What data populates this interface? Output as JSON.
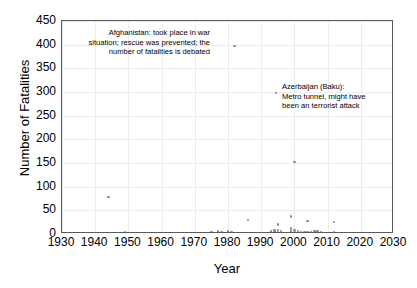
{
  "chart_data": {
    "type": "scatter",
    "title": "",
    "xlabel": "Year",
    "ylabel": "Number of Fatalities",
    "xlim": [
      1930,
      2030
    ],
    "ylim": [
      0,
      450
    ],
    "xticks": [
      1930,
      1940,
      1950,
      1960,
      1970,
      1980,
      1990,
      2000,
      2010,
      2020,
      2030
    ],
    "yticks": [
      0,
      50,
      100,
      150,
      200,
      250,
      300,
      350,
      400,
      450
    ],
    "grid": true,
    "legend": "none",
    "marker_color": "#8a8a8a",
    "axis_color": "#5a5a5a",
    "grid_color": "#ececf0",
    "points": [
      {
        "x": 1944,
        "y": 78
      },
      {
        "x": 1949,
        "y": 3
      },
      {
        "x": 1950,
        "y": 2
      },
      {
        "x": 1960,
        "y": 2
      },
      {
        "x": 1975,
        "y": 3
      },
      {
        "x": 1976,
        "y": 1
      },
      {
        "x": 1977,
        "y": 5
      },
      {
        "x": 1978,
        "y": 4
      },
      {
        "x": 1978,
        "y": 1
      },
      {
        "x": 1979,
        "y": 2
      },
      {
        "x": 1980,
        "y": 5
      },
      {
        "x": 1981,
        "y": 4
      },
      {
        "x": 1982,
        "y": 397
      },
      {
        "x": 1982,
        "y": 2
      },
      {
        "x": 1984,
        "y": 2
      },
      {
        "x": 1985,
        "y": 1
      },
      {
        "x": 1986,
        "y": 30
      },
      {
        "x": 1986,
        "y": 1
      },
      {
        "x": 1990,
        "y": 1
      },
      {
        "x": 1992,
        "y": 2
      },
      {
        "x": 1993,
        "y": 5
      },
      {
        "x": 1993,
        "y": 2
      },
      {
        "x": 1994,
        "y": 7
      },
      {
        "x": 1994,
        "y": 3
      },
      {
        "x": 1995,
        "y": 20
      },
      {
        "x": 1995,
        "y": 9
      },
      {
        "x": 1995,
        "y": 4
      },
      {
        "x": 1995,
        "y": 2
      },
      {
        "x": 1996,
        "y": 6
      },
      {
        "x": 1996,
        "y": 2
      },
      {
        "x": 1997,
        "y": 1
      },
      {
        "x": 1999,
        "y": 37
      },
      {
        "x": 1999,
        "y": 12
      },
      {
        "x": 1999,
        "y": 5
      },
      {
        "x": 2000,
        "y": 152
      },
      {
        "x": 2000,
        "y": 8
      },
      {
        "x": 2000,
        "y": 3
      },
      {
        "x": 2001,
        "y": 6
      },
      {
        "x": 2001,
        "y": 2
      },
      {
        "x": 2002,
        "y": 4
      },
      {
        "x": 2003,
        "y": 3
      },
      {
        "x": 2003,
        "y": 1
      },
      {
        "x": 2004,
        "y": 28
      },
      {
        "x": 2004,
        "y": 3
      },
      {
        "x": 2005,
        "y": 2
      },
      {
        "x": 2005,
        "y": 4
      },
      {
        "x": 2006,
        "y": 5
      },
      {
        "x": 2006,
        "y": 2
      },
      {
        "x": 2007,
        "y": 3
      },
      {
        "x": 2007,
        "y": 6
      },
      {
        "x": 2008,
        "y": 2
      },
      {
        "x": 2008,
        "y": 4
      },
      {
        "x": 2009,
        "y": 1
      },
      {
        "x": 2010,
        "y": 2
      },
      {
        "x": 2012,
        "y": 26
      },
      {
        "x": 2012,
        "y": 3
      }
    ],
    "annotations": [
      {
        "id": "afghanistan",
        "text": "Afghanistan: took place in war situation; rescue was prevented; the number of fatalities is debated",
        "align": "right",
        "target_point": {
          "x": 1982,
          "y": 397
        }
      },
      {
        "id": "azerbaijan",
        "text": "Azerbaijan (Baku):\nMetro tunnel, might have\nbeen an terrorist attack",
        "align": "left",
        "target_point": {
          "x": 2000,
          "y": 152
        }
      }
    ]
  }
}
